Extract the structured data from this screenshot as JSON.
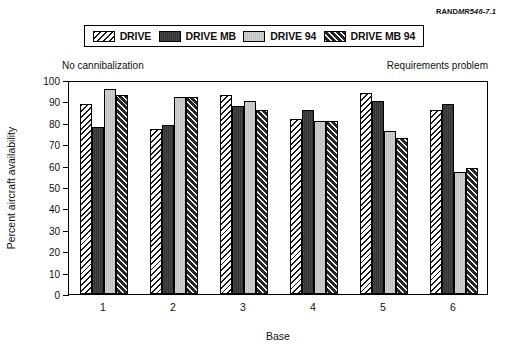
{
  "source_id": {
    "brand": "RAND",
    "code": "MR546-7.1"
  },
  "annotations": {
    "left": "No cannibalization",
    "right": "Requirements problem"
  },
  "legend": {
    "entries": [
      {
        "label": "DRIVE",
        "swatch": "hatch-dark-on-white"
      },
      {
        "label": "DRIVE MB",
        "swatch": "solid-dark"
      },
      {
        "label": "DRIVE 94",
        "swatch": "solid-light-gray"
      },
      {
        "label": "DRIVE MB 94",
        "swatch": "hatch-white-on-dark"
      }
    ]
  },
  "chart_data": {
    "type": "bar",
    "title": "",
    "xlabel": "Base",
    "ylabel": "Percent aircraft availability",
    "categories": [
      "1",
      "2",
      "3",
      "4",
      "5",
      "6"
    ],
    "ylim": [
      0,
      100
    ],
    "yticks": [
      0,
      10,
      20,
      30,
      40,
      50,
      60,
      70,
      80,
      90,
      100
    ],
    "grid": false,
    "legend_position": "top",
    "series": [
      {
        "name": "DRIVE",
        "values": [
          89,
          77,
          93,
          82,
          94,
          86
        ]
      },
      {
        "name": "DRIVE MB",
        "values": [
          78,
          79,
          88,
          86,
          90,
          89
        ]
      },
      {
        "name": "DRIVE 94",
        "values": [
          96,
          92,
          90,
          81,
          76,
          57
        ]
      },
      {
        "name": "DRIVE MB 94",
        "values": [
          93,
          92,
          86,
          81,
          73,
          59
        ]
      }
    ]
  }
}
